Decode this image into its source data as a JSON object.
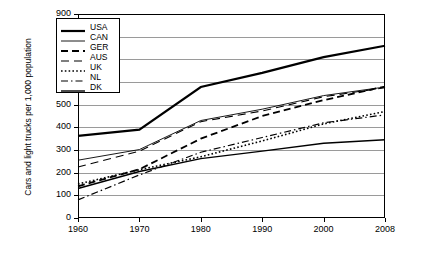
{
  "chart_data": {
    "type": "line",
    "title": "",
    "xlabel": "",
    "ylabel": "Cars and light trucks per 1,000 population",
    "x": [
      1960,
      1970,
      1980,
      1990,
      2000,
      2008
    ],
    "xticklabels": [
      "1960",
      "1970",
      "1980",
      "1990",
      "2000",
      "2008"
    ],
    "yticklabels": [
      "0",
      "100",
      "200",
      "300",
      "400",
      "500",
      "600",
      "700",
      "800",
      "900"
    ],
    "yticks": [
      0,
      100,
      200,
      300,
      400,
      500,
      600,
      700,
      800,
      900
    ],
    "ylim": [
      0,
      900
    ],
    "grid": "horizontal",
    "legend_position": "upper-left-inside",
    "series": [
      {
        "name": "USA",
        "style": "solid-thick",
        "values": [
          362,
          390,
          578,
          640,
          710,
          760
        ]
      },
      {
        "name": "CAN",
        "style": "solid-thin",
        "values": [
          255,
          302,
          430,
          480,
          540,
          578
        ]
      },
      {
        "name": "GER",
        "style": "dashed",
        "values": [
          140,
          215,
          350,
          450,
          520,
          580
        ]
      },
      {
        "name": "AUS",
        "style": "long-dash",
        "values": [
          225,
          295,
          425,
          472,
          535,
          575
        ]
      },
      {
        "name": "UK",
        "style": "dotted",
        "values": [
          150,
          213,
          270,
          340,
          415,
          470
        ]
      },
      {
        "name": "NL",
        "style": "dash-dot",
        "values": [
          80,
          190,
          290,
          355,
          420,
          455
        ]
      },
      {
        "name": "DK",
        "style": "solid-medium",
        "values": [
          130,
          205,
          262,
          295,
          330,
          345
        ]
      }
    ]
  },
  "legend": {
    "items": [
      {
        "label": "USA"
      },
      {
        "label": "CAN"
      },
      {
        "label": "GER"
      },
      {
        "label": "AUS"
      },
      {
        "label": "UK"
      },
      {
        "label": "NL"
      },
      {
        "label": "DK"
      }
    ]
  },
  "colors": {
    "line": "#000000",
    "grid": "#9a9a9a",
    "axis": "#000000",
    "background": "#ffffff"
  }
}
